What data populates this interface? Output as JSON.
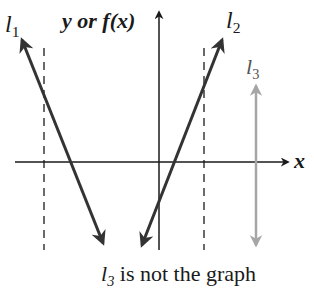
{
  "diagram": {
    "y_axis_label": {
      "main": "y or f(x)"
    },
    "x_axis_label": "x",
    "lines": [
      {
        "id": "l1",
        "name": "l",
        "sub": "1",
        "color": "#333333"
      },
      {
        "id": "l2",
        "name": "l",
        "sub": "2",
        "color": "#333333"
      },
      {
        "id": "l3",
        "name": "l",
        "sub": "3",
        "color": "#a6a6a6"
      }
    ],
    "caption": {
      "name": "l",
      "sub": "3",
      "text": " is not the graph"
    },
    "colors": {
      "axis": "#1a1a1a",
      "function_line": "#333333",
      "vertical_line": "#a6a6a6",
      "dashed": "#1a1a1a"
    }
  }
}
